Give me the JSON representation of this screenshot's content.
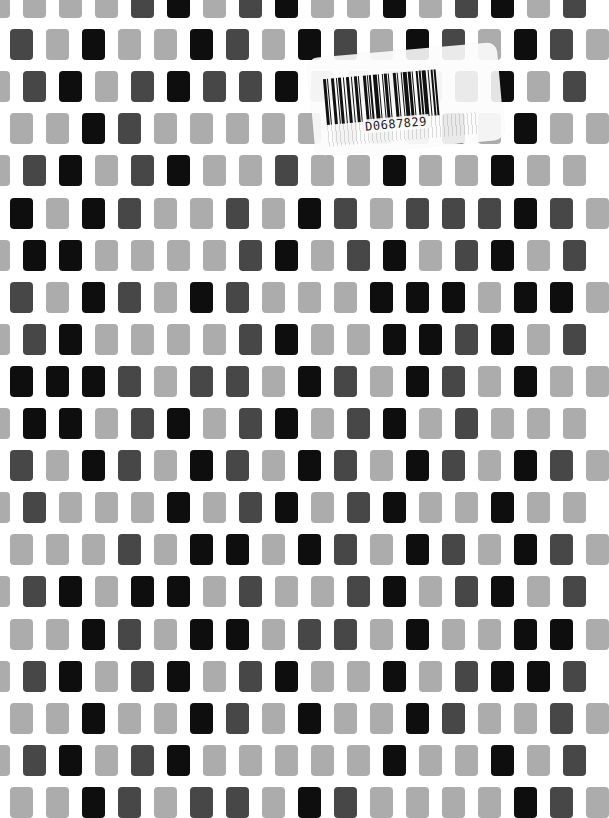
{
  "pattern": {
    "description": "Staggered mosaic of rounded rectangular tiles in three shades",
    "palette": {
      "L": "#acacac",
      "D": "#474747",
      "B": "#0e0e0e"
    },
    "rows": [
      {
        "offset": "even",
        "tiles": "LLLLDBLDBLLBLDBLD"
      },
      {
        "offset": "odd",
        "tiles": "DLBLLBDLBDLBDLBDL"
      },
      {
        "offset": "even",
        "tiles": "LDBLDBDDBLLLLDBLD"
      },
      {
        "offset": "odd",
        "tiles": "LLBDLLLLLLLLDLBLL"
      },
      {
        "offset": "even",
        "tiles": "LDBLDBLLDLLBLLBLL"
      },
      {
        "offset": "odd",
        "tiles": "BLBDLLDLBDLDDDBDL"
      },
      {
        "offset": "even",
        "tiles": "LBBLLLLDBLDBLDBLD"
      },
      {
        "offset": "odd",
        "tiles": "DLBDLBDLLLBBBLBBL"
      },
      {
        "offset": "even",
        "tiles": "LDBLLLLDBLLBBDBLD"
      },
      {
        "offset": "odd",
        "tiles": "BBBDLDDLBDLBDLBLL"
      },
      {
        "offset": "even",
        "tiles": "LBBLDBLDBLDBLDLLL"
      },
      {
        "offset": "odd",
        "tiles": "DLBDLBDLBDLBDLBDL"
      },
      {
        "offset": "even",
        "tiles": "LDLLLBLDBLDBLLBLL"
      },
      {
        "offset": "odd",
        "tiles": "LLLDLBBLBDLBDLBDL"
      },
      {
        "offset": "even",
        "tiles": "LDBLBBLDLLDBLDBLD"
      },
      {
        "offset": "odd",
        "tiles": "LLBDLBBLDDLBLLBBL"
      },
      {
        "offset": "even",
        "tiles": "LDBLDBLDBLLBLDBBD"
      },
      {
        "offset": "odd",
        "tiles": "LLBLLBDLBLLBDLLDL"
      },
      {
        "offset": "even",
        "tiles": "LDBLDBLLLLLBLLBLD"
      },
      {
        "offset": "odd",
        "tiles": "LLBDLDDLBDLLLLBDL"
      }
    ]
  },
  "sticker": {
    "type": "barcode-label",
    "barcode_text": "D0687829"
  }
}
